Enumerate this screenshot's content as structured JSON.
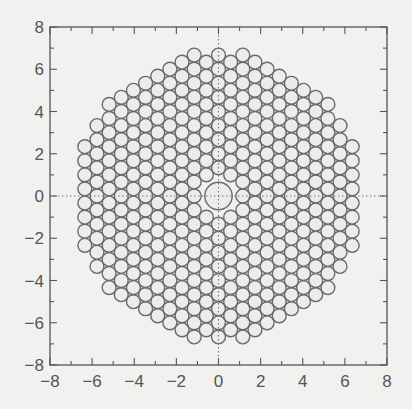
{
  "chart_data": {
    "type": "scatter",
    "title": "",
    "xlabel": "",
    "ylabel": "",
    "xlim": [
      -8,
      8
    ],
    "ylim": [
      -8,
      8
    ],
    "xticks": [
      -8,
      -6,
      -4,
      -2,
      0,
      2,
      4,
      6,
      8
    ],
    "yticks": [
      -8,
      -6,
      -4,
      -2,
      0,
      2,
      4,
      6,
      8
    ],
    "xtick_labels": [
      "−8",
      "−6",
      "−4",
      "−2",
      "0",
      "2",
      "4",
      "6",
      "8"
    ],
    "ytick_labels": [
      "−8",
      "−6",
      "−4",
      "−2",
      "0",
      "2",
      "4",
      "6",
      "8"
    ],
    "minor_tick_step": 1,
    "grid": false,
    "legend": null,
    "packing": {
      "lattice": "hexagonal-columns",
      "column_spacing": 0.577,
      "row_spacing": 0.667,
      "circle_radius": 0.33,
      "boundary_radius": 7.2,
      "center_circle_radius": 0.65,
      "center_exclusion_radius": 0.95
    },
    "reference_lines": [
      {
        "orientation": "vertical",
        "x": 0,
        "style": "dotted"
      },
      {
        "orientation": "horizontal",
        "y": 0,
        "style": "dotted"
      }
    ]
  },
  "colors": {
    "background": "#f1f1ef",
    "axes": "#555555",
    "circle_stroke": "#6a6a6a",
    "circle_fill": "#ececea"
  }
}
